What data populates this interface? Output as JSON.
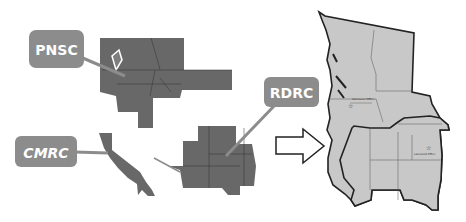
{
  "diagram": {
    "callouts": [
      {
        "id": "pnsc",
        "label": "PNSC"
      },
      {
        "id": "cmrc",
        "label": "CMRC"
      },
      {
        "id": "rdrc",
        "label": "RDRC"
      }
    ],
    "arrow": "right-arrow",
    "merged_map": {
      "offices": [
        {
          "label": "Vancouver Office",
          "icon": "star-icon"
        },
        {
          "label": "Lakewood Office",
          "icon": "star-icon"
        }
      ]
    },
    "colors": {
      "region_fill": "#686868",
      "merged_fill": "#c8c8c8",
      "callout_fill": "#8c8c8c",
      "border": "#222222"
    }
  }
}
